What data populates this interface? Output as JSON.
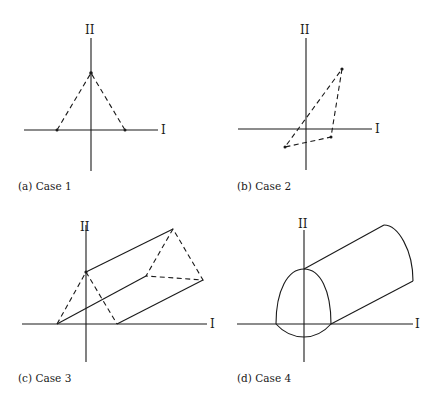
{
  "panels": [
    {
      "id": "a",
      "caption": "(a) Case 1",
      "x_axis_label": "I",
      "y_axis_label": "II",
      "shape": "dashed triangle: apex on axis II, base vertices on axis I symmetric about origin"
    },
    {
      "id": "b",
      "caption": "(b) Case 2",
      "x_axis_label": "I",
      "y_axis_label": "II",
      "shape": "dashed skewed triangle spanning quadrants I, III, IV"
    },
    {
      "id": "c",
      "caption": "(c) Case 3",
      "x_axis_label": "I",
      "y_axis_label": "II",
      "shape": "triangular prism: dashed triangle cross-sections, solid extrusion edges"
    },
    {
      "id": "d",
      "caption": "(d) Case 4",
      "x_axis_label": "I",
      "y_axis_label": "II",
      "shape": "dome-shaped cross-section extruded into a cylinder"
    }
  ],
  "colors": {
    "ink": "#1a1a1a",
    "background": "#ffffff"
  }
}
